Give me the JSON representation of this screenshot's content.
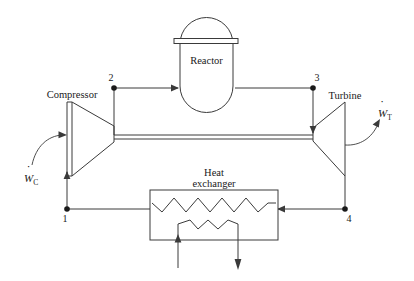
{
  "figure": {
    "background_color": "#ffffff",
    "line_color": "#3a3a3a",
    "text_color": "#1a1a1a"
  },
  "components": {
    "compressor": {
      "label": "Compressor",
      "icon": "compressor-trapezoid-icon"
    },
    "turbine": {
      "label": "Turbine",
      "icon": "turbine-trapezoid-icon"
    },
    "reactor": {
      "label": "Reactor",
      "icon": "reactor-vessel-icon"
    },
    "heat_exchanger": {
      "label_line1": "Heat",
      "label_line2": "exchanger",
      "icon": "heat-exchanger-icon"
    }
  },
  "work_labels": {
    "compressor_work": {
      "symbol": "W",
      "dot": "̇",
      "subscript": "C",
      "full": "Ẇ_C",
      "direction": "into-compressor"
    },
    "turbine_work": {
      "symbol": "W",
      "dot": "̇",
      "subscript": "T",
      "full": "Ẇ_T",
      "direction": "out-of-turbine"
    }
  },
  "state_points": [
    {
      "id": "1",
      "label": "1",
      "x": 67,
      "y": 209
    },
    {
      "id": "2",
      "label": "2",
      "x": 114,
      "y": 88
    },
    {
      "id": "3",
      "label": "3",
      "x": 313,
      "y": 88
    },
    {
      "id": "4",
      "label": "4",
      "x": 345,
      "y": 209
    }
  ],
  "flow_arrows": {
    "reactor_inlet": "arrow-right-icon",
    "turbine_inlet": "arrow-down-icon",
    "compressor_inlet": "arrow-up-icon",
    "hx_hot_inlet": "arrow-left-icon",
    "coolant_in": "arrow-up-icon",
    "coolant_out": "arrow-down-icon"
  },
  "heat_exchanger_detail": {
    "hot_side_zigzag_peaks": 5,
    "cold_side_zigzag_peaks": 3,
    "coolant_inlet_label": "",
    "coolant_outlet_label": ""
  }
}
